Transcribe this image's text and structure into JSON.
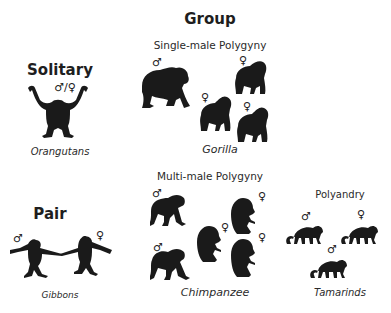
{
  "header": {
    "title": "Group"
  },
  "sections": {
    "solitary": {
      "title": "Solitary",
      "sex_symbol": "♂/♀",
      "species": "Orangutans"
    },
    "pair": {
      "title": "Pair",
      "male_symbol": "♂",
      "female_symbol": "♀",
      "species": "Gibbons"
    },
    "single_male_polygyny": {
      "title": "Single-male Polygyny",
      "species": "Gorilla",
      "symbols": [
        "♂",
        "♀",
        "♀",
        "♀"
      ]
    },
    "multi_male_polygyny": {
      "title": "Multi-male Polygyny",
      "species": "Chimpanzee",
      "symbols": [
        "♂",
        "♂",
        "♀",
        "♀",
        "♀"
      ]
    },
    "polyandry": {
      "title": "Polyandry",
      "species": "Tamarinds",
      "symbols": [
        "♂",
        "♀",
        "♂"
      ]
    }
  },
  "colors": {
    "silhouette": "#1a1a1a",
    "text": "#1e1e1e",
    "background": "#ffffff"
  }
}
